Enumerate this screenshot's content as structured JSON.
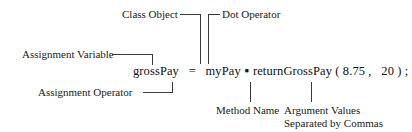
{
  "figure": {
    "type": "annotated-code-diagram",
    "background": "#ffffff",
    "line_color": "#3a3a3a",
    "text_color": "#1a1a1a"
  },
  "code": {
    "assignment_variable": "grossPay",
    "assignment_operator": "=",
    "class_object": "myPay",
    "dot_operator": "▪",
    "method_name": "returnGrossPay",
    "open_paren": "(",
    "argument_1": "8.75",
    "comma": ",",
    "argument_2": "20",
    "close_paren": ")",
    "semicolon": ";",
    "full_text": "grossPay = myPay.returnGrossPay(8.75, 20);"
  },
  "annotations": {
    "class_object": "Class Object",
    "dot_operator": "Dot Operator",
    "assignment_variable": "Assignment Variable",
    "assignment_operator": "Assignment Operator",
    "method_name": "Method Name",
    "argument_values_line1": "Argument Values",
    "argument_values_line2": "Separated by Commas"
  }
}
